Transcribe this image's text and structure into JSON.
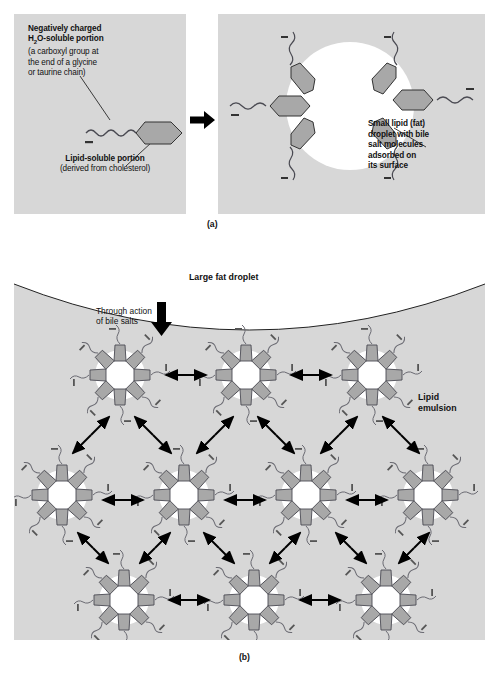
{
  "figure": {
    "panel_a": {
      "caption": "(a)",
      "left": {
        "label_negative": {
          "bold_lines": [
            "Negatively charged",
            "H2O-soluble portion"
          ],
          "bold_line_1": "Negatively charged",
          "bold_line_2_pre": "H",
          "bold_line_2_sub": "2",
          "bold_line_2_post": "O-soluble portion",
          "plain_lines": [
            "(a carboxyl group at",
            "the end of a glycine",
            "or taurine chain)"
          ],
          "plain_line_1": "(a carboxyl group at",
          "plain_line_2": "the end of a glycine",
          "plain_line_3": "or taurine chain)"
        },
        "label_lipid": {
          "bold_line": "Lipid-soluble portion",
          "plain_line": "(derived from cholesterol)"
        },
        "molecule_charge_symbol": "–"
      },
      "process_arrow": "right-arrow-icon",
      "right": {
        "label_small_droplet": [
          "Small lipid (fat)",
          "droplet with bile",
          "salt molecules",
          "adsorbed on",
          "its surface"
        ],
        "bile_salt_count": 6,
        "charge_symbol": "–"
      }
    },
    "panel_b": {
      "caption": "(b)",
      "label_large_fat_droplet": "Large fat droplet",
      "label_through_action": [
        "Through action",
        "of bile salts"
      ],
      "label_lipid_emulsion": [
        "Lipid",
        "emulsion"
      ],
      "micelle_rows": [
        3,
        4,
        3
      ],
      "micelle_count_total": 10,
      "bile_salts_per_micelle": 8,
      "charge_symbol": "–"
    },
    "colors": {
      "panel_background": "#d7d7d7",
      "page_background": "#ffffff",
      "droplet_fill": "#ffffff",
      "molecule_fill": "#a8a8a8",
      "molecule_stroke": "#333333",
      "text": "#111111",
      "arrow": "#000000"
    }
  }
}
